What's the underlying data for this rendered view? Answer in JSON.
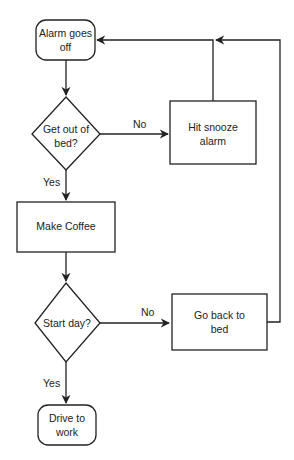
{
  "diagram": {
    "type": "flowchart",
    "nodes": {
      "alarm": {
        "shape": "terminal",
        "lines": [
          "Alarm goes",
          "off"
        ]
      },
      "get_out": {
        "shape": "decision",
        "lines": [
          "Get out of",
          "bed?"
        ]
      },
      "snooze": {
        "shape": "process",
        "lines": [
          "Hit snooze",
          "alarm"
        ]
      },
      "coffee": {
        "shape": "process",
        "lines": [
          "Make Coffee"
        ]
      },
      "start_day": {
        "shape": "decision",
        "lines": [
          "Start day?"
        ]
      },
      "back_to_bed": {
        "shape": "process",
        "lines": [
          "Go back to",
          "bed"
        ]
      },
      "drive": {
        "shape": "terminal",
        "lines": [
          "Drive to",
          "work"
        ]
      }
    },
    "edges": [
      {
        "from": "alarm",
        "to": "get_out",
        "label": ""
      },
      {
        "from": "get_out",
        "to": "snooze",
        "label": "No"
      },
      {
        "from": "get_out",
        "to": "coffee",
        "label": "Yes"
      },
      {
        "from": "snooze",
        "to": "alarm",
        "label": ""
      },
      {
        "from": "coffee",
        "to": "start_day",
        "label": ""
      },
      {
        "from": "start_day",
        "to": "back_to_bed",
        "label": "No"
      },
      {
        "from": "start_day",
        "to": "drive",
        "label": "Yes"
      },
      {
        "from": "back_to_bed",
        "to": "alarm",
        "label": ""
      }
    ],
    "labels": {
      "no1": "No",
      "yes1": "Yes",
      "no2": "No",
      "yes2": "Yes"
    },
    "colors": {
      "stroke": "#222222",
      "text": "#222222",
      "background": "#ffffff"
    }
  }
}
